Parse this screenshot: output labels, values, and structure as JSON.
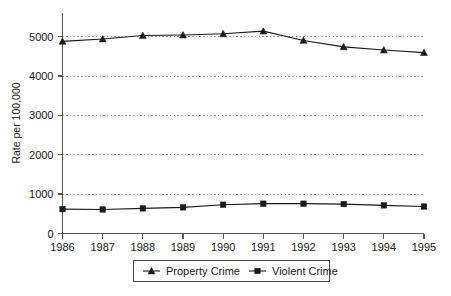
{
  "chart_data": {
    "type": "line",
    "title": "",
    "xlabel": "",
    "ylabel": "Rate per 100,000",
    "categories": [
      "1986",
      "1987",
      "1988",
      "1989",
      "1990",
      "1991",
      "1992",
      "1993",
      "1994",
      "1995"
    ],
    "x": [
      1986,
      1987,
      1988,
      1989,
      1990,
      1991,
      1992,
      1993,
      1994,
      1995
    ],
    "series": [
      {
        "name": "Property Crime",
        "marker": "triangle",
        "color": "#1a1a1a",
        "values": [
          4880,
          4940,
          5027,
          5041,
          5073,
          5140,
          4903,
          4740,
          4660,
          4593
        ]
      },
      {
        "name": "Violent Crime",
        "marker": "square",
        "color": "#1a1a1a",
        "values": [
          618,
          610,
          637,
          663,
          732,
          758,
          758,
          747,
          714,
          685
        ]
      }
    ],
    "ylim": [
      0,
      5600
    ],
    "yticks": [
      0,
      1000,
      2000,
      3000,
      4000,
      5000
    ],
    "ytick_labels": [
      "0",
      "1000",
      "2000",
      "3000",
      "4000",
      "5000"
    ],
    "grid": "horizontal-dotted",
    "legend_position": "bottom-center",
    "legend": [
      "Property Crime",
      "Violent Crime"
    ]
  },
  "axis": {
    "y_title": "Rate per 100,000"
  }
}
